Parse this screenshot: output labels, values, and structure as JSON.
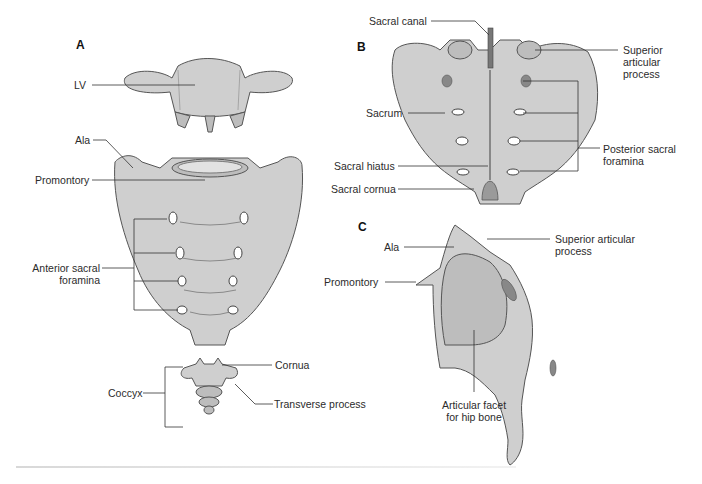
{
  "figure": {
    "panels": {
      "A": {
        "letter": "A",
        "view": "anterior",
        "labels": {
          "lv": "LV",
          "ala": "Ala",
          "promontory": "Promontory",
          "anterior_sacral_foramina_line1": "Anterior sacral",
          "anterior_sacral_foramina_line2": "foramina",
          "coccyx": "Coccyx",
          "cornua": "Cornua",
          "transverse_process": "Transverse process"
        }
      },
      "B": {
        "letter": "B",
        "view": "posterior",
        "labels": {
          "sacral_canal": "Sacral canal",
          "superior_articular_process_line1": "Superior",
          "superior_articular_process_line2": "articular",
          "superior_articular_process_line3": "process",
          "sacrum": "Sacrum",
          "posterior_sacral_foramina_line1": "Posterior sacral",
          "posterior_sacral_foramina_line2": "foramina",
          "sacral_hiatus": "Sacral hiatus",
          "sacral_cornua": "Sacral cornua"
        }
      },
      "C": {
        "letter": "C",
        "view": "lateral",
        "labels": {
          "ala": "Ala",
          "superior_articular_process_line1": "Superior articular",
          "superior_articular_process_line2": "process",
          "promontory": "Promontory",
          "articular_facet_line1": "Articular facet",
          "articular_facet_line2": "for hip bone"
        }
      }
    },
    "colors": {
      "bone": "#cfcfcf",
      "bone_shadow": "#bdbdbd",
      "outline": "#555555",
      "leader_line": "#333333",
      "text": "#2b2b2b",
      "background": "#ffffff"
    }
  }
}
